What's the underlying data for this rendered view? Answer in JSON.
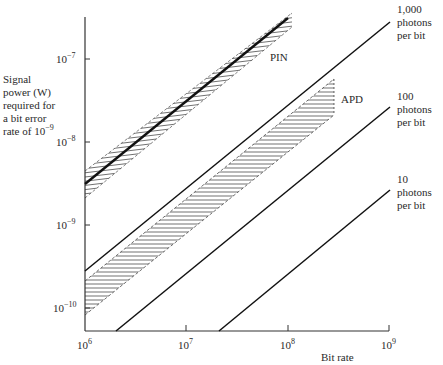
{
  "chart_data": {
    "type": "line",
    "title": "",
    "xlabel": "Bit rate",
    "ylabel": "Signal power (W) required for a bit error rate of 10^-9",
    "xscale": "log",
    "yscale": "log",
    "xlim": [
      1000000,
      1000000000
    ],
    "ylim": [
      5e-11,
      3e-07
    ],
    "x_ticks": [
      "10^6",
      "10^7",
      "10^8",
      "10^9"
    ],
    "y_ticks": [
      "10^-10",
      "10^-9",
      "10^-8",
      "10^-7"
    ],
    "grid": false,
    "series": [
      {
        "name": "1,000 photons per bit",
        "style": "solid line",
        "x": [
          1000000,
          1000000000
        ],
        "y": [
          2.8e-10,
          2.8e-07
        ]
      },
      {
        "name": "100 photons per bit",
        "style": "solid line",
        "x": [
          2000000,
          1000000000
        ],
        "y": [
          5.6e-11,
          2.8e-08
        ]
      },
      {
        "name": "10 photons per bit",
        "style": "solid line",
        "x": [
          20000000,
          1000000000
        ],
        "y": [
          5.6e-11,
          2.8e-09
        ]
      },
      {
        "name": "PIN",
        "style": "hatched band with center line",
        "x": [
          1000000,
          110000000
        ],
        "y_center": [
          3.1e-09,
          3.4e-07
        ],
        "y_upper": [
          5e-09,
          4.2e-07
        ],
        "y_lower": [
          2e-09,
          2.6e-07
        ]
      },
      {
        "name": "APD",
        "style": "hatched band",
        "x": [
          1000000,
          290000000
        ],
        "y_upper": [
          2.1e-10,
          5.8e-08
        ],
        "y_lower": [
          8.3e-11,
          2e-08
        ]
      }
    ],
    "annotations": [
      "PIN",
      "APD",
      "1,000 photons per bit",
      "100 photons per bit",
      "10 photons per bit"
    ]
  },
  "labels": {
    "ylabel_lines": [
      "Signal",
      "power (W)",
      "required for",
      "a bit error",
      "rate of 10"
    ],
    "ylabel_exp": "−9",
    "xlabel": "Bit rate",
    "pin": "PIN",
    "apd": "APD",
    "l1000": [
      "1,000",
      "photons",
      "per bit"
    ],
    "l100": [
      "100",
      "photons",
      "per bit"
    ],
    "l10": [
      "10",
      "photons",
      "per bit"
    ],
    "xticks": [
      {
        "base": "10",
        "exp": "6"
      },
      {
        "base": "10",
        "exp": "7"
      },
      {
        "base": "10",
        "exp": "8"
      },
      {
        "base": "10",
        "exp": "9"
      }
    ],
    "yticks": [
      {
        "base": "10",
        "exp": "−7"
      },
      {
        "base": "10",
        "exp": "−8"
      },
      {
        "base": "10",
        "exp": "−9"
      },
      {
        "base": "10",
        "exp": "−10"
      }
    ]
  }
}
